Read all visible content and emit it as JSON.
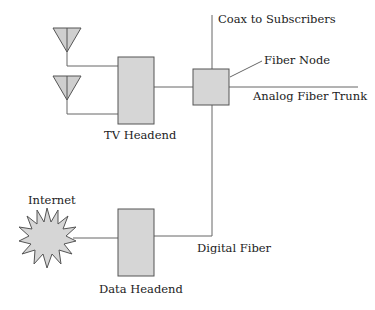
{
  "diagram": {
    "colors": {
      "line": "#666666",
      "box_fill": "#d6d6d6",
      "box_stroke": "#555555"
    },
    "labels": {
      "coax": "Coax to Subscribers",
      "fiber_node": "Fiber Node",
      "analog_trunk": "Analog Fiber Trunk",
      "tv_headend": "TV Headend",
      "internet": "Internet",
      "digital_fiber": "Digital Fiber",
      "data_headend": "Data Headend"
    },
    "nodes": [
      {
        "id": "antenna-1",
        "type": "antenna"
      },
      {
        "id": "antenna-2",
        "type": "antenna"
      },
      {
        "id": "tv-headend",
        "type": "box",
        "label": "TV Headend"
      },
      {
        "id": "fiber-node",
        "type": "box",
        "label": "Fiber Node"
      },
      {
        "id": "internet",
        "type": "starburst",
        "label": "Internet"
      },
      {
        "id": "data-headend",
        "type": "box",
        "label": "Data Headend"
      }
    ],
    "edges": [
      {
        "from": "antenna-1",
        "to": "tv-headend"
      },
      {
        "from": "antenna-2",
        "to": "tv-headend"
      },
      {
        "from": "tv-headend",
        "to": "fiber-node"
      },
      {
        "from": "fiber-node",
        "to": "subscribers",
        "label": "Coax to Subscribers"
      },
      {
        "from": "fiber-node",
        "to": "trunk",
        "label": "Analog Fiber Trunk"
      },
      {
        "from": "internet",
        "to": "data-headend"
      },
      {
        "from": "data-headend",
        "to": "fiber-node",
        "label": "Digital Fiber"
      }
    ]
  }
}
